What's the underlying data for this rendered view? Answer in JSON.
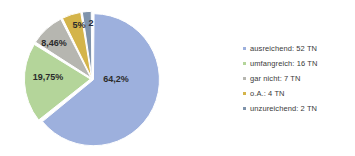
{
  "chart_data": {
    "type": "pie",
    "title": "",
    "subtitle": "",
    "xlabel": "",
    "ylabel": "",
    "grid": false,
    "legend_position": "right",
    "total": 81,
    "unit": "TN",
    "categories": [
      "ausreichend",
      "umfangreich",
      "gar nicht",
      "o.A.",
      "unzureichend"
    ],
    "values": [
      52,
      16,
      7,
      4,
      2
    ],
    "percent_labels": [
      "64,2%",
      "19,75%",
      "8,46%",
      "5%",
      "2"
    ],
    "colors": [
      "#9db0dd",
      "#b4d59a",
      "#b6b6b0",
      "#d4b44a",
      "#7f93ab"
    ],
    "slices": [
      {
        "label": "ausreichend",
        "value": 52,
        "percent": 64.2,
        "percent_label": "64,2%",
        "color": "#9db0dd",
        "legend_label": "ausreichend: 52 TN"
      },
      {
        "label": "umfangreich",
        "value": 16,
        "percent": 19.75,
        "percent_label": "19,75%",
        "color": "#b4d59a",
        "legend_label": "umfangreich: 16 TN"
      },
      {
        "label": "gar nicht",
        "value": 7,
        "percent": 8.46,
        "percent_label": "8,46%",
        "color": "#b6b6b0",
        "legend_label": "gar nicht: 7 TN"
      },
      {
        "label": "o.A.",
        "value": 4,
        "percent": 5.0,
        "percent_label": "5%",
        "color": "#d4b44a",
        "legend_label": "o.A.: 4 TN"
      },
      {
        "label": "unzureichend",
        "value": 2,
        "percent": 2.0,
        "percent_label": "2",
        "color": "#7f93ab",
        "legend_label": "unzureichend: 2 TN"
      }
    ]
  },
  "legend": {
    "items": [
      {
        "label": "ausreichend: 52 TN",
        "color": "#9db0dd"
      },
      {
        "label": "umfangreich: 16 TN",
        "color": "#b4d59a"
      },
      {
        "label": "gar nicht: 7 TN",
        "color": "#b6b6b0"
      },
      {
        "label": "o.A.: 4 TN",
        "color": "#d4b44a"
      },
      {
        "label": "unzureichend: 2 TN",
        "color": "#7f93ab"
      }
    ]
  },
  "labels": {
    "slice_1": "64,2%",
    "slice_2": "19,75%",
    "slice_3": "8,46%",
    "slice_4": "5%",
    "slice_5": "2"
  }
}
